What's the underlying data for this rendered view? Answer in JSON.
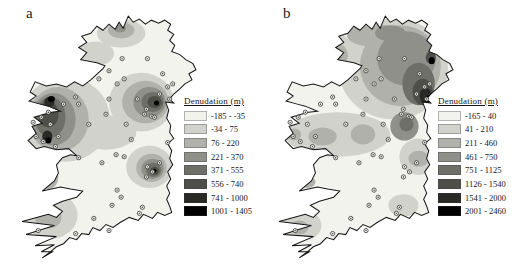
{
  "figure": {
    "palette": [
      "#f3f3ed",
      "#d2d2cc",
      "#b1b1ab",
      "#90908a",
      "#6f6f6a",
      "#4f4f4a",
      "#292926",
      "#000000"
    ],
    "coastline": "M107,3 L112,9 L118,6 L124,11 L130,7 L137,10 L143,7 L149,11 L146,17 L152,21 L148,27 L153,32 L150,38 L158,41 L164,46 L171,50 L174,56 L167,60 L170,66 L163,70 L158,75 L152,80 L148,85 L152,89 L144,88 L147,96 L145,104 L149,111 L148,118 L152,124 L146,129 L150,136 L148,144 L151,150 L146,157 L149,164 L145,171 L148,178 L145,184 L148,191 L150,197 L143,200 L136,197 L131,203 L122,199 L117,205 L108,202 L99,207 L92,212 L85,209 L79,215 L72,212 L68,219 L61,218 L56,224 L49,222 L43,228 L36,231 L30,236 L22,242 L32,236 L21,236 L34,229 L15,230 L36,221 L6,219 L34,210 L2,206 L28,199 L36,202 L42,196 L33,190 L42,186 L56,182 L62,176 L50,174 L40,172 L22,176 L34,166 L38,158 L36,150 L42,143 L50,140 L56,141 L48,134 L36,135 L24,132 L16,134 L8,126 L16,119 L12,112 L22,109 L14,103 L24,100 L31,98 L40,97 L28,92 L20,90 L9,87 L16,82 L10,78 L15,68 L26,72 L36,70 L46,73 L54,68 L62,72 L70,66 L82,55 L84,52 L76,49 L60,46 L66,39 L58,34 L66,29 L61,23 L70,20 L76,13 L82,17 L88,11 L94,16 L98,9 L102,15 Z",
    "sample_points": [
      [
        101,
        45
      ],
      [
        88,
        57
      ],
      [
        103,
        65
      ],
      [
        96,
        70
      ],
      [
        78,
        65
      ],
      [
        126,
        45
      ],
      [
        141,
        60
      ],
      [
        146,
        73
      ],
      [
        151,
        70
      ],
      [
        138,
        80
      ],
      [
        148,
        85
      ],
      [
        88,
        85
      ],
      [
        55,
        83
      ],
      [
        43,
        90
      ],
      [
        58,
        90
      ],
      [
        116,
        85
      ],
      [
        125,
        95
      ],
      [
        123,
        100
      ],
      [
        130,
        102
      ],
      [
        133,
        103
      ],
      [
        21,
        103
      ],
      [
        28,
        98
      ],
      [
        13,
        108
      ],
      [
        30,
        110
      ],
      [
        38,
        122
      ],
      [
        16,
        122
      ],
      [
        23,
        127
      ],
      [
        35,
        132
      ],
      [
        68,
        110
      ],
      [
        105,
        110
      ],
      [
        110,
        125
      ],
      [
        85,
        100
      ],
      [
        95,
        140
      ],
      [
        103,
        142
      ],
      [
        81,
        148
      ],
      [
        58,
        143
      ],
      [
        126,
        152
      ],
      [
        131,
        157
      ],
      [
        125,
        162
      ],
      [
        138,
        148
      ],
      [
        146,
        128
      ],
      [
        96,
        175
      ],
      [
        100,
        182
      ],
      [
        91,
        190
      ],
      [
        73,
        203
      ],
      [
        18,
        215
      ],
      [
        55,
        218
      ],
      [
        88,
        215
      ],
      [
        118,
        198
      ],
      [
        121,
        192
      ]
    ],
    "panels": [
      {
        "label": "a",
        "legend": {
          "title": "Denudation (m)",
          "classes": [
            "-185 - -35",
            "-34 - 75",
            "76 - 220",
            "221 - 370",
            "371 - 555",
            "556 - 740",
            "741 - 1000",
            "1001 - 1405"
          ]
        },
        "blobs": [
          [
            100,
            20,
            24,
            14,
            1
          ],
          [
            75,
            40,
            18,
            12,
            1
          ],
          [
            45,
            105,
            44,
            42,
            1
          ],
          [
            85,
            118,
            30,
            17,
            1
          ],
          [
            120,
            88,
            32,
            29,
            1
          ],
          [
            128,
            152,
            23,
            21,
            1
          ],
          [
            30,
            200,
            27,
            23,
            1
          ],
          [
            100,
            17,
            13,
            8,
            2
          ],
          [
            38,
            105,
            30,
            32,
            2
          ],
          [
            124,
            88,
            23,
            21,
            2
          ],
          [
            130,
            153,
            15,
            14,
            2
          ],
          [
            28,
            162,
            10,
            12,
            2
          ],
          [
            28,
            202,
            13,
            11,
            2
          ],
          [
            99,
            15,
            6,
            4,
            3
          ],
          [
            33,
            105,
            22,
            26,
            3
          ],
          [
            128,
            88,
            16,
            15,
            3
          ],
          [
            131,
            154,
            11,
            10,
            3
          ],
          [
            30,
            103,
            15,
            20,
            4
          ],
          [
            131,
            88,
            11,
            10,
            4
          ],
          [
            132,
            155,
            7.5,
            7,
            4
          ],
          [
            26,
            162,
            6,
            8,
            4
          ],
          [
            28,
            100,
            10,
            13,
            5
          ],
          [
            133,
            88,
            7,
            6,
            5
          ],
          [
            133,
            156,
            4.5,
            4,
            5
          ],
          [
            29,
            88,
            5,
            5,
            6
          ],
          [
            27,
            122,
            5,
            6,
            6
          ],
          [
            25,
            162,
            3.5,
            5.5,
            6
          ],
          [
            31,
            85,
            3.5,
            3,
            7
          ],
          [
            28,
            126,
            3,
            3,
            7
          ],
          [
            135,
            89,
            2.5,
            2.5,
            7
          ],
          [
            133,
            156,
            2,
            2,
            7
          ]
        ]
      },
      {
        "label": "b",
        "legend": {
          "title": "Denudation (m)",
          "classes": [
            "-165 - 40",
            "41 - 210",
            "211 - 460",
            "461 - 750",
            "751 - 1125",
            "1126 - 1540",
            "1541 - 2000",
            "2001 - 2460"
          ]
        },
        "blobs": [
          [
            115,
            55,
            54,
            50,
            1
          ],
          [
            60,
            120,
            52,
            22,
            1
          ],
          [
            140,
            142,
            19,
            18,
            1
          ],
          [
            25,
            210,
            19,
            15,
            1
          ],
          [
            125,
            190,
            15,
            11,
            1
          ],
          [
            52,
            42,
            27,
            23,
            1
          ],
          [
            52,
            42,
            18,
            15,
            2
          ],
          [
            122,
            52,
            40,
            40,
            2
          ],
          [
            95,
            22,
            26,
            11,
            2
          ],
          [
            45,
            122,
            14,
            9,
            2
          ],
          [
            85,
            120,
            12,
            10,
            2
          ],
          [
            17,
            120,
            7,
            6,
            2
          ],
          [
            30,
            167,
            8,
            6,
            2
          ],
          [
            140,
            144,
            10,
            8,
            2
          ],
          [
            22,
            212,
            9,
            7,
            2
          ],
          [
            52,
            42,
            11,
            9,
            3
          ],
          [
            128,
            45,
            29,
            27,
            3
          ],
          [
            112,
            20,
            15,
            8,
            3
          ],
          [
            126,
            112,
            14,
            14,
            3
          ],
          [
            51,
            42,
            6,
            5,
            4
          ],
          [
            140,
            70,
            16,
            21,
            4
          ],
          [
            128,
            110,
            7,
            7,
            4
          ],
          [
            144,
            78,
            10,
            13,
            5
          ],
          [
            152,
            44,
            5,
            6,
            5
          ],
          [
            147,
            82,
            6,
            8,
            6
          ],
          [
            150,
            86,
            4,
            4.5,
            7
          ],
          [
            153,
            47,
            3,
            3.5,
            7
          ]
        ]
      }
    ]
  }
}
